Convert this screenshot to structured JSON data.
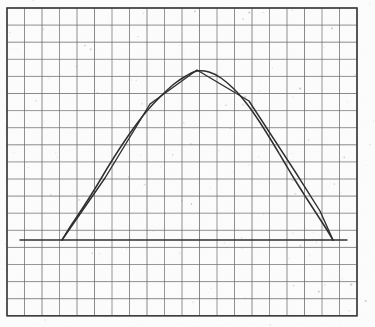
{
  "figure": {
    "kind": "scanned-graph-paper-plot",
    "caption": "Hand-drawn arch curve with piecewise-linear approximation on graph paper",
    "background_color": "#fdfdfd",
    "ink_color": "#2b2b2b",
    "grid_color": "#6a6a6a",
    "frame_color": "#3a3a3a"
  },
  "grid": {
    "cols": 20,
    "rows": 18,
    "cell_width": 17.5,
    "cell_height": 17.1,
    "origin_x": 7,
    "origin_y": 8,
    "line_width": 0.9,
    "frame_line_width": 1.6,
    "visible": true
  },
  "chart_data": {
    "type": "line",
    "title": "",
    "subtitle": "",
    "xlabel": "",
    "ylabel": "",
    "xlim": [
      7,
      357
    ],
    "ylim": [
      316,
      8
    ],
    "grid": true,
    "legend": "none",
    "annotations": [],
    "tick_labels": {
      "x": [],
      "y": []
    },
    "baseline": {
      "name": "baseline",
      "y": 240,
      "x_start": 20,
      "x_end": 347,
      "stroke": "#2b2b2b",
      "stroke_width": 1.3
    },
    "series": [
      {
        "name": "smooth-arch-curve",
        "stroke": "#2b2b2b",
        "stroke_width": 1.5,
        "smooth": true,
        "points": [
          [
            62,
            240
          ],
          [
            72,
            224
          ],
          [
            84,
            206
          ],
          [
            96,
            187
          ],
          [
            108,
            167
          ],
          [
            120,
            148
          ],
          [
            133,
            129
          ],
          [
            146,
            112
          ],
          [
            160,
            97
          ],
          [
            174,
            84
          ],
          [
            186,
            76
          ],
          [
            197,
            71
          ],
          [
            209,
            72
          ],
          [
            221,
            78
          ],
          [
            234,
            89
          ],
          [
            247,
            104
          ],
          [
            259,
            121
          ],
          [
            271,
            140
          ],
          [
            283,
            160
          ],
          [
            295,
            180
          ],
          [
            307,
            199
          ],
          [
            318,
            216
          ],
          [
            327,
            230
          ],
          [
            333,
            240
          ]
        ]
      },
      {
        "name": "piecewise-linear-approximation",
        "stroke": "#2b2b2b",
        "stroke_width": 1.4,
        "smooth": false,
        "points": [
          [
            62,
            240
          ],
          [
            105,
            178
          ],
          [
            150,
            104
          ],
          [
            197,
            70
          ],
          [
            249,
            101
          ],
          [
            296,
            173
          ],
          [
            320,
            211
          ],
          [
            333,
            240
          ]
        ]
      }
    ]
  },
  "scan_texture": {
    "speckle_count": 140,
    "speckle_color": "#9a9a9a",
    "edge_shadow_color": "#efefef"
  }
}
